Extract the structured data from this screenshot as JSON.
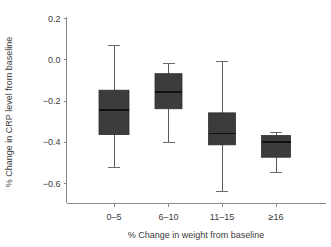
{
  "chart_data": {
    "type": "box",
    "title": "",
    "xlabel": "% Change in weight from baseline",
    "ylabel": "% Change in CRP level from baseline",
    "categories": [
      "0–5",
      "6–10",
      "11–15",
      "≥16"
    ],
    "ylim": [
      -0.7,
      0.2
    ],
    "yticks": [
      0.2,
      0.0,
      -0.2,
      -0.4,
      -0.6
    ],
    "ytick_labels": [
      "0.2",
      "0.0",
      "−0.2",
      "−0.4",
      "−0.6"
    ],
    "grid": false,
    "legend": "none",
    "box_color": "#3c3c3c",
    "median_color": "#111111",
    "whisker_color": "#5a5a5a",
    "axis_color": "#8a8a8a",
    "boxes": [
      {
        "category": "0–5",
        "whisker_high": 0.07,
        "q3": -0.15,
        "median": -0.245,
        "q1": -0.365,
        "whisker_low": -0.52
      },
      {
        "category": "6–10",
        "whisker_high": -0.02,
        "q3": -0.07,
        "median": -0.16,
        "q1": -0.24,
        "whisker_low": -0.4
      },
      {
        "category": "11–15",
        "whisker_high": -0.01,
        "q3": -0.26,
        "median": -0.36,
        "q1": -0.415,
        "whisker_low": -0.64
      },
      {
        "category": "≥16",
        "whisker_high": -0.355,
        "q3": -0.37,
        "median": -0.4,
        "q1": -0.475,
        "whisker_low": -0.545
      }
    ]
  }
}
